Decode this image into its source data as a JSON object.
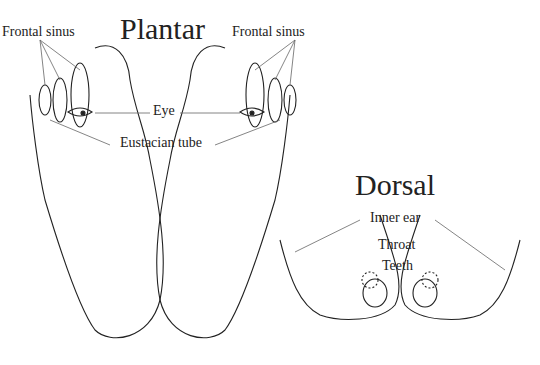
{
  "titles": {
    "plantar": "Plantar",
    "dorsal": "Dorsal"
  },
  "labels": {
    "frontal_sinus_left": "Frontal sinus",
    "frontal_sinus_right": "Frontal sinus",
    "eye": "Eye",
    "eustachian": "Eustacian tube",
    "inner_ear": "Inner ear",
    "throat": "Throat",
    "teeth": "Teeth"
  },
  "colors": {
    "line": "#222222",
    "leader": "#666666"
  }
}
